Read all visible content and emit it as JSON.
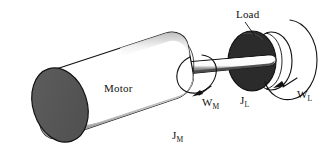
{
  "figure": {
    "background_color": "#ffffff",
    "outline_color": "#111111",
    "motor_end_cap_color": "#575757",
    "motor_body_color": "#ffffff",
    "motor_shadow_color": "#8c8c8c",
    "load_disk_color": "#2b2b2b",
    "load_rim_color": "#ffffff",
    "shaft_color": "#ffffff",
    "shaft_shadow_color": "#555555"
  },
  "labels": {
    "motor": "Motor",
    "load": "Load",
    "motor_inertia": "J",
    "motor_inertia_sub": "M",
    "motor_speed": "W",
    "motor_speed_sub": "M",
    "load_inertia": "J",
    "load_inertia_sub": "L",
    "load_speed": "W",
    "load_speed_sub": "L"
  },
  "components": [
    {
      "name": "motor",
      "label": "Motor",
      "shape": "cylinder",
      "inertia_symbol": "J_M",
      "speed_symbol": "W_M"
    },
    {
      "name": "shaft",
      "label": "",
      "shape": "rod",
      "inertia_symbol": "",
      "speed_symbol": ""
    },
    {
      "name": "load",
      "label": "Load",
      "shape": "disk",
      "inertia_symbol": "J_L",
      "speed_symbol": "W_L"
    }
  ],
  "annotations": {
    "motor_rotation_arrow": "curved-arrow-around-shaft",
    "load_rotation_arrow": "curved-arrow-around-load",
    "load_leader_line": "line-from-load-label-to-disk"
  }
}
